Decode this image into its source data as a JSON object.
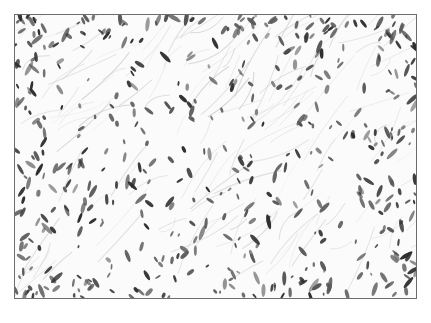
{
  "image": {
    "description": "Grayscale histology micrograph of loose fibrous tissue with scattered spindle-shaped nuclei",
    "frame": {
      "x": 14,
      "y": 14,
      "width": 403,
      "height": 285,
      "border_color": "#6d6d6d"
    },
    "colors": {
      "background": "#fbfbfb",
      "nucleus_dark": "#2e2e2e",
      "nucleus_mid": "#5a5a5a",
      "fiber": "#c9c9c9"
    },
    "generation": {
      "seed": 1337,
      "nuclei_count": 520,
      "fiber_count": 140,
      "edge_density_boost": 0.35
    }
  }
}
